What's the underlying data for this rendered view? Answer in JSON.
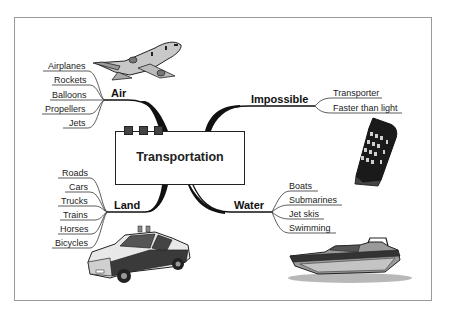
{
  "diagram": {
    "type": "mind-map",
    "center": {
      "title": "Transportation"
    },
    "branches": [
      {
        "label": "Air",
        "position": "top-left",
        "items": [
          "Airplanes",
          "Rockets",
          "Balloons",
          "Propellers",
          "Jets"
        ],
        "image": "airplane-icon"
      },
      {
        "label": "Impossible",
        "position": "top-right",
        "items": [
          "Transporter",
          "Faster than light"
        ],
        "image": "phone-box-icon"
      },
      {
        "label": "Land",
        "position": "bottom-left",
        "items": [
          "Roads",
          "Cars",
          "Trucks",
          "Trains",
          "Horses",
          "Bicycles"
        ],
        "image": "police-car-icon"
      },
      {
        "label": "Water",
        "position": "bottom-right",
        "items": [
          "Boats",
          "Submarines",
          "Jet skis",
          "Swimming"
        ],
        "image": "speedboat-icon"
      }
    ]
  },
  "colors": {
    "line": "#111111",
    "border": "#9a9a9a",
    "text": "#222222",
    "squares": "#444444"
  }
}
